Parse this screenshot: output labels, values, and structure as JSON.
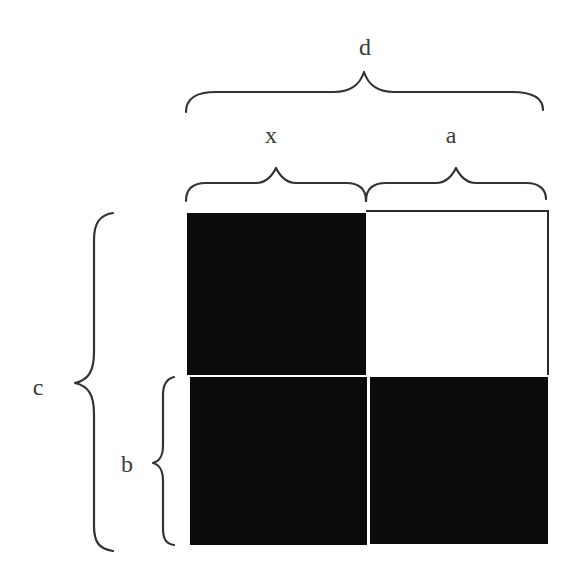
{
  "diagram": {
    "title": "",
    "labels": {
      "d": "d",
      "x": "x",
      "a": "a",
      "c": "c",
      "b": "b"
    },
    "braces": [
      {
        "id": "brace-d",
        "label": "d",
        "orientation": "top",
        "spans": "x + a (full width)"
      },
      {
        "id": "brace-x",
        "label": "x",
        "orientation": "top",
        "spans": "left column"
      },
      {
        "id": "brace-a",
        "label": "a",
        "orientation": "top",
        "spans": "right column"
      },
      {
        "id": "brace-c",
        "label": "c",
        "orientation": "left",
        "spans": "full height"
      },
      {
        "id": "brace-b",
        "label": "b",
        "orientation": "left",
        "spans": "bottom row"
      }
    ],
    "grid": {
      "rows": 2,
      "cols": 2,
      "cells": [
        {
          "row": 0,
          "col": 0,
          "fill": "black"
        },
        {
          "row": 0,
          "col": 1,
          "fill": "white"
        },
        {
          "row": 1,
          "col": 0,
          "fill": "black"
        },
        {
          "row": 1,
          "col": 1,
          "fill": "black"
        }
      ]
    },
    "colors": {
      "filled": "#0b0b0b",
      "empty": "#ffffff",
      "stroke": "#333333",
      "text": "#3a3a3a"
    }
  }
}
